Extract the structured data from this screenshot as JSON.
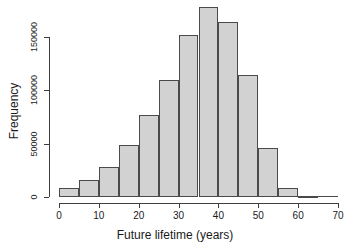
{
  "chart_data": {
    "type": "bar",
    "title": "",
    "subtitle": "",
    "xlabel": "Future lifetime (years)",
    "ylabel": "Frequency",
    "xlim": [
      0,
      70
    ],
    "ylim": [
      0,
      180000
    ],
    "grid": false,
    "legend": null,
    "bin_width": 5,
    "x_ticks": [
      0,
      10,
      20,
      30,
      40,
      50,
      60,
      70
    ],
    "x_tick_labels": [
      "0",
      "10",
      "20",
      "30",
      "40",
      "50",
      "60",
      "70"
    ],
    "y_ticks": [
      0,
      50000,
      100000,
      150000
    ],
    "y_tick_labels": [
      "0",
      "50000",
      "100000",
      "150000"
    ],
    "bin_edges": [
      0,
      5,
      10,
      15,
      20,
      25,
      30,
      35,
      40,
      45,
      50,
      55,
      60,
      65,
      70
    ],
    "categories": [
      "0-5",
      "5-10",
      "10-15",
      "15-20",
      "20-25",
      "25-30",
      "30-35",
      "35-40",
      "40-45",
      "45-50",
      "50-55",
      "55-60",
      "60-65",
      "65-70"
    ],
    "values": [
      8500,
      15500,
      28000,
      48500,
      77000,
      110000,
      152000,
      178000,
      164000,
      114000,
      46000,
      8500,
      900,
      0
    ],
    "colors": {
      "bar_fill": "#d2d2d2",
      "bar_border": "#4a4a4a",
      "axis": "#3d3d3d",
      "text": "#1a1a1a",
      "background": "#ffffff"
    }
  }
}
